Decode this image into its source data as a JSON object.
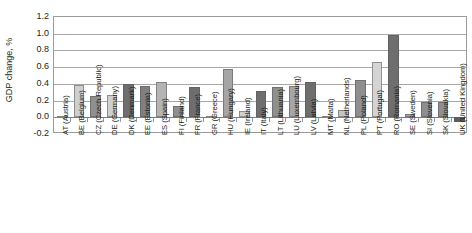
{
  "chart_data": {
    "type": "bar",
    "title": "",
    "xlabel": "",
    "ylabel": "GDP change, %",
    "ylim": [
      -0.2,
      1.2
    ],
    "ytick_labels": [
      "1.2",
      "1.0",
      "0.8",
      "0.6",
      "0.4",
      "0.2",
      "0.0",
      "-0.2"
    ],
    "ytick_values": [
      1.2,
      1.0,
      0.8,
      0.6,
      0.4,
      0.2,
      0.0,
      -0.2
    ],
    "grid": true,
    "legend": "none",
    "categories": [
      "AT (Austria)",
      "BE (Belgium)",
      "CZ (Czech Republic)",
      "DE (Germany)",
      "DK (Denmark)",
      "EE (Estonia)",
      "ES (Spain)",
      "FI (Finland)",
      "FR (France)",
      "GR (Greece)",
      "HU (Hungary)",
      "IE (Ireland)",
      "IT (Italy)",
      "LT (Lithuania)",
      "LU (Luxembourg)",
      "LV (Latvia)",
      "MT (Malta)",
      "NL (Netherlands)",
      "PL (Poland)",
      "PT (Portugal)",
      "RO (Romania)",
      "SE (Sweden)",
      "SI (Slovenia)",
      "SK (Slovakia)",
      "UK (United Kingdom)"
    ],
    "values": [
      0.01,
      0.39,
      0.25,
      0.27,
      0.4,
      0.37,
      0.42,
      0.14,
      0.36,
      0.01,
      0.58,
      0.07,
      0.31,
      0.36,
      0.38,
      0.42,
      0.01,
      0.09,
      0.45,
      0.66,
      0.98,
      0.04,
      0.18,
      0.18,
      -0.06
    ],
    "bar_colors": [
      "#b4b4b4",
      "#cfcfcf",
      "#8f8f8f",
      "#cfcfcf",
      "#6e6e6e",
      "#7f7f7f",
      "#b4b4b4",
      "#8f8f8f",
      "#6e6e6e",
      "#b4b4b4",
      "#a5a5a5",
      "#cfcfcf",
      "#6e6e6e",
      "#8f8f8f",
      "#a5a5a5",
      "#6e6e6e",
      "#b4b4b4",
      "#c4c4c4",
      "#8f8f8f",
      "#d4d4d4",
      "#6e6e6e",
      "#a5a5a5",
      "#8f8f8f",
      "#8f8f8f",
      "#5e5e5e"
    ]
  },
  "colors": {
    "axis": "#9b9b9b",
    "grid": "#a8a8a8",
    "text": "#231f20",
    "background": "#ffffff"
  }
}
